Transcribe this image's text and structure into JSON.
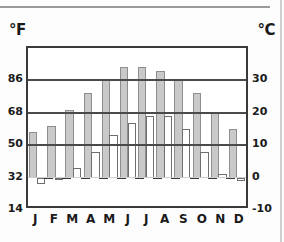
{
  "chart_data": {
    "type": "bar",
    "title": "",
    "subtitle": "",
    "xlabel": "",
    "ylabel": "°F",
    "ylabel_right": "°C",
    "categories": [
      "J",
      "F",
      "M",
      "A",
      "M",
      "J",
      "J",
      "A",
      "S",
      "O",
      "N",
      "D"
    ],
    "grid": true,
    "legend_position": "none",
    "axis_left": {
      "unit": "°F",
      "ticks": [
        86,
        68,
        50,
        32,
        14
      ],
      "ylim": [
        14,
        104
      ]
    },
    "axis_right": {
      "unit": "°C",
      "ticks": [
        30,
        20,
        10,
        0,
        -10
      ],
      "ylim": [
        -10,
        40
      ]
    },
    "series": [
      {
        "name": "High",
        "color": "#c9c9c9",
        "unit": "°C",
        "values": [
          14,
          16,
          21,
          26,
          30,
          34,
          34,
          33,
          30,
          26,
          20,
          15
        ]
      },
      {
        "name": "Low",
        "color": "#ffffff",
        "unit": "°C",
        "values": [
          -2,
          0,
          3,
          8,
          13,
          17,
          19,
          19,
          15,
          8,
          1,
          -1
        ]
      }
    ]
  },
  "labels": {
    "unit_left": "°F",
    "unit_right": "°C",
    "left_ticks": [
      "86",
      "68",
      "50",
      "32",
      "14"
    ],
    "right_ticks": [
      "30",
      "20",
      "10",
      "0",
      "-10"
    ],
    "months": [
      "J",
      "F",
      "M",
      "A",
      "M",
      "J",
      "J",
      "A",
      "S",
      "O",
      "N",
      "D"
    ]
  }
}
